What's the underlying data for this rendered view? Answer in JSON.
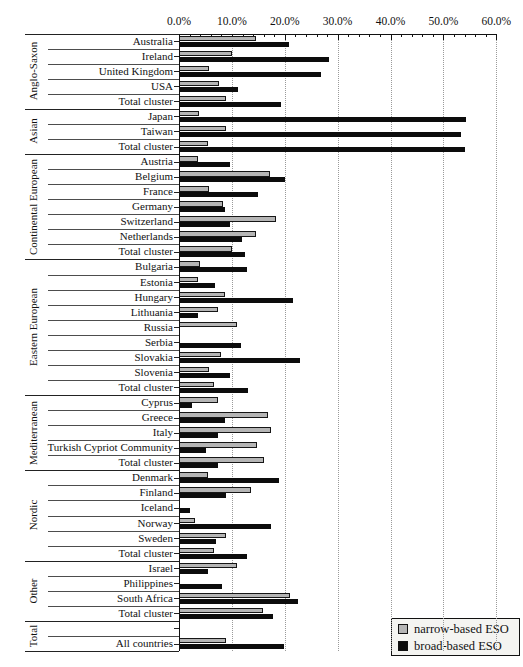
{
  "chart": {
    "axis": {
      "tick_labels": [
        "0.0%",
        "10.0%",
        "20.0%",
        "30.0%",
        "40.0%",
        "50.0%",
        "60.0%"
      ],
      "tick_values": [
        0,
        10,
        20,
        30,
        40,
        50,
        60
      ],
      "minor_step": 2,
      "max": 60
    },
    "legend": {
      "items": [
        {
          "name": "narrow-eso",
          "label": "narrow-based ESO",
          "color": "#b5b5b5"
        },
        {
          "name": "broad-eso",
          "label": "broad-based ESO",
          "color": "#0c0c0c"
        }
      ]
    },
    "colors": {
      "narrow_fill": "#b5b5b5",
      "narrow_border": "#161616",
      "broad_fill": "#0c0c0c",
      "gridline": "#9a9a9a"
    }
  },
  "chart_data": {
    "type": "bar",
    "orientation": "horizontal",
    "unit": "percent",
    "xlim": [
      0,
      60
    ],
    "x_tick_labels": [
      "0.0%",
      "10.0%",
      "20.0%",
      "30.0%",
      "40.0%",
      "50.0%",
      "60.0%"
    ],
    "grid": "dotted-vertical-major",
    "legend_position": "bottom-right",
    "series": [
      "narrow-based ESO",
      "broad-based ESO"
    ],
    "groups": [
      {
        "label": "Anglo-Saxon",
        "rows": [
          {
            "label": "Australia",
            "narrow": 14.6,
            "broad": 20.8
          },
          {
            "label": "Ireland",
            "narrow": 10.1,
            "broad": 28.4
          },
          {
            "label": "United Kingdom",
            "narrow": 5.7,
            "broad": 26.9
          },
          {
            "label": "USA",
            "narrow": 7.6,
            "broad": 11.1
          },
          {
            "label": "Total cluster",
            "narrow": 8.8,
            "broad": 19.2
          }
        ]
      },
      {
        "label": "Asian",
        "rows": [
          {
            "label": "Japan",
            "narrow": 3.7,
            "broad": 54.2
          },
          {
            "label": "Taiwan",
            "narrow": 8.9,
            "broad": 53.4
          },
          {
            "label": "Total cluster",
            "narrow": 5.5,
            "broad": 54.0
          }
        ]
      },
      {
        "label": "Continental European",
        "rows": [
          {
            "label": "Austria",
            "narrow": 3.5,
            "broad": 9.7
          },
          {
            "label": "Belgium",
            "narrow": 17.2,
            "broad": 20.1
          },
          {
            "label": "France",
            "narrow": 5.7,
            "broad": 15.0
          },
          {
            "label": "Germany",
            "narrow": 8.3,
            "broad": 8.7
          },
          {
            "label": "Switzerland",
            "narrow": 18.4,
            "broad": 9.7
          },
          {
            "label": "Netherlands",
            "narrow": 14.6,
            "broad": 11.9
          },
          {
            "label": "Total cluster",
            "narrow": 10.1,
            "broad": 12.5
          }
        ]
      },
      {
        "label": "Eastern European",
        "rows": [
          {
            "label": "Bulgaria",
            "narrow": 4.0,
            "broad": 12.8
          },
          {
            "label": "Estonia",
            "narrow": 3.5,
            "broad": 6.8
          },
          {
            "label": "Hungary",
            "narrow": 8.6,
            "broad": 21.6
          },
          {
            "label": "Lithuania",
            "narrow": 7.4,
            "broad": 3.5
          },
          {
            "label": "Russia",
            "narrow": 11.0,
            "broad": 0
          },
          {
            "label": "Serbia",
            "narrow": 0,
            "broad": 11.7
          },
          {
            "label": "Slovakia",
            "narrow": 7.9,
            "broad": 22.8
          },
          {
            "label": "Slovenia",
            "narrow": 5.7,
            "broad": 9.7
          },
          {
            "label": "Total cluster",
            "narrow": 6.7,
            "broad": 13.1
          }
        ]
      },
      {
        "label": "Mediterranean",
        "rows": [
          {
            "label": "Cyprus",
            "narrow": 7.3,
            "broad": 2.4
          },
          {
            "label": "Greece",
            "narrow": 16.9,
            "broad": 8.7
          },
          {
            "label": "Italy",
            "narrow": 17.4,
            "broad": 7.3
          },
          {
            "label": "Turkish Cypriot Community",
            "narrow": 14.8,
            "broad": 5.1
          },
          {
            "label": "Total cluster",
            "narrow": 16.0,
            "broad": 7.3
          }
        ]
      },
      {
        "label": "Nordic",
        "rows": [
          {
            "label": "Denmark",
            "narrow": 5.5,
            "broad": 18.9
          },
          {
            "label": "Finland",
            "narrow": 13.6,
            "broad": 8.9
          },
          {
            "label": "Iceland",
            "narrow": 0,
            "broad": 2.1
          },
          {
            "label": "Norway",
            "narrow": 3.0,
            "broad": 17.4
          },
          {
            "label": "Sweden",
            "narrow": 8.9,
            "broad": 7.0
          },
          {
            "label": "Total cluster",
            "narrow": 6.6,
            "broad": 12.8
          }
        ]
      },
      {
        "label": "Other",
        "rows": [
          {
            "label": "Israel",
            "narrow": 11.0,
            "broad": 5.5
          },
          {
            "label": "Philippines",
            "narrow": 0,
            "broad": 8.1
          },
          {
            "label": "South Africa",
            "narrow": 20.9,
            "broad": 22.4
          },
          {
            "label": "Total cluster",
            "narrow": 15.9,
            "broad": 17.7
          }
        ]
      },
      {
        "label": "Total",
        "rows": [
          {
            "label": "",
            "narrow": null,
            "broad": null
          },
          {
            "label": "All countries",
            "narrow": 8.9,
            "broad": 19.9
          }
        ]
      }
    ]
  }
}
